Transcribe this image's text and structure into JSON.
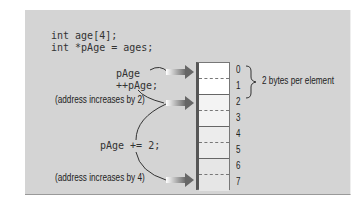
{
  "code": {
    "line1": "int age[4];",
    "line2": "int *pAge = ages;",
    "stmt1": "pAge",
    "stmt2": "++pAge;",
    "stmt3": "pAge += 2;"
  },
  "notes": {
    "inc2": "(address increases by 2)",
    "inc4": "(address increases by 4)",
    "bytes": "2 bytes per element"
  },
  "memory": {
    "indices": [
      "0",
      "1",
      "2",
      "3",
      "4",
      "5",
      "6",
      "7"
    ]
  }
}
